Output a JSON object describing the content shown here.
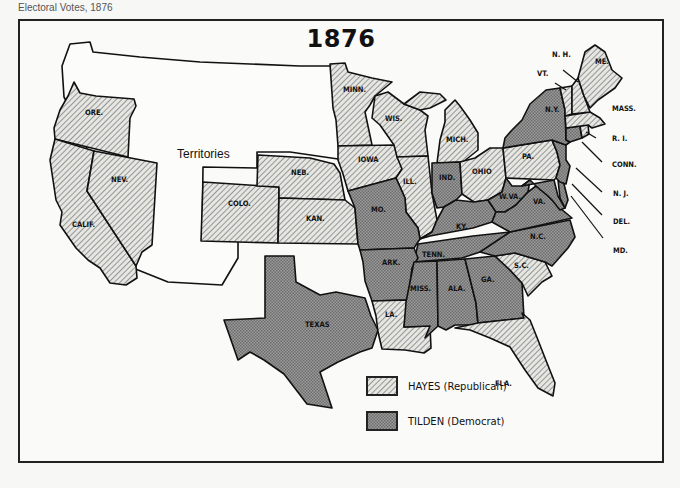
{
  "page_header": "Electoral Votes, 1876",
  "map": {
    "title": "1876",
    "territories_label": "Territories",
    "colors": {
      "republican_hatch_bg": "#e4e4e0",
      "republican_hatch_line": "#6a6a6a",
      "democrat_fill": "#8f8f8f",
      "outline": "#111111"
    },
    "legend": [
      {
        "key": "republican",
        "label": "HAYES (Republican)",
        "pattern": "diagonal-hatch"
      },
      {
        "key": "democrat",
        "label": "TILDEN (Democrat)",
        "pattern": "stipple-dark"
      }
    ],
    "states": {
      "republican": [
        "ORE.",
        "CALIF.",
        "NEV.",
        "COLO.",
        "NEB.",
        "KAN.",
        "MINN.",
        "IOWA",
        "WIS.",
        "ILL.",
        "MICH.",
        "OHIO",
        "PA.",
        "LA.",
        "S.C.",
        "FLA.",
        "VT.",
        "N.H.",
        "ME.",
        "MASS.",
        "R.I."
      ],
      "democrat": [
        "TEXAS",
        "MO.",
        "ARK.",
        "IND.",
        "KY.",
        "TENN.",
        "MISS.",
        "ALA.",
        "GA.",
        "W.VA.",
        "VA.",
        "N.C.",
        "N.Y.",
        "N.J.",
        "CONN.",
        "DEL.",
        "MD."
      ]
    },
    "labels": {
      "ore": "ORE.",
      "calif": "CALIF.",
      "nev": "NEV.",
      "colo": "COLO.",
      "neb": "NEB.",
      "kan": "KAN.",
      "minn": "MINN.",
      "iowa": "IOWA",
      "wis": "WIS.",
      "ill": "ILL.",
      "mich": "MICH.",
      "ind": "IND.",
      "ohio": "OHIO",
      "mo": "MO.",
      "ky": "KY.",
      "tenn": "TENN.",
      "ark": "ARK.",
      "texas": "TEXAS",
      "la": "LA.",
      "miss": "MISS.",
      "ala": "ALA.",
      "ga": "GA.",
      "sc": "S.C.",
      "nc": "N.C.",
      "va": "VA.",
      "wva": "W.VA.",
      "pa": "PA.",
      "ny": "N.Y.",
      "fla": "FLA.",
      "vt": "VT.",
      "nh": "N. H.",
      "me": "ME.",
      "mass": "MASS.",
      "ri": "R. I.",
      "conn": "CONN.",
      "nj": "N. J.",
      "del": "DEL.",
      "md": "MD."
    }
  }
}
